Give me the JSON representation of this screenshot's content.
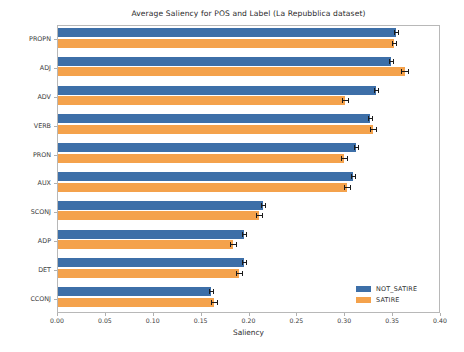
{
  "chart_data": {
    "type": "bar",
    "orientation": "horizontal",
    "title": "Average Saliency for POS and Label (La Repubblica dataset)",
    "xlabel": "Saliency",
    "ylabel": "Part Of Speech",
    "categories": [
      "PROPN",
      "ADJ",
      "ADV",
      "VERB",
      "PRON",
      "AUX",
      "SCONJ",
      "ADP",
      "DET",
      "CCONJ"
    ],
    "series": [
      {
        "name": "NOT_SATIRE",
        "color": "#3d6fa8",
        "values": [
          0.353,
          0.348,
          0.332,
          0.326,
          0.311,
          0.308,
          0.214,
          0.194,
          0.194,
          0.16
        ],
        "errors": [
          0.002,
          0.002,
          0.002,
          0.002,
          0.002,
          0.002,
          0.002,
          0.002,
          0.002,
          0.002
        ]
      },
      {
        "name": "SATIRE",
        "color": "#f4a24c",
        "values": [
          0.351,
          0.362,
          0.3,
          0.329,
          0.299,
          0.302,
          0.21,
          0.183,
          0.189,
          0.163
        ],
        "errors": [
          0.002,
          0.004,
          0.003,
          0.003,
          0.003,
          0.003,
          0.003,
          0.003,
          0.003,
          0.003
        ]
      }
    ],
    "xlim": [
      0.0,
      0.4
    ],
    "xticks": [
      0.0,
      0.05,
      0.1,
      0.15,
      0.2,
      0.25,
      0.3,
      0.35,
      0.4
    ],
    "xtick_labels": [
      "0.00",
      "0.05",
      "0.10",
      "0.15",
      "0.20",
      "0.25",
      "0.30",
      "0.35",
      "0.40"
    ],
    "grid": false,
    "legend_position": "lower right"
  }
}
